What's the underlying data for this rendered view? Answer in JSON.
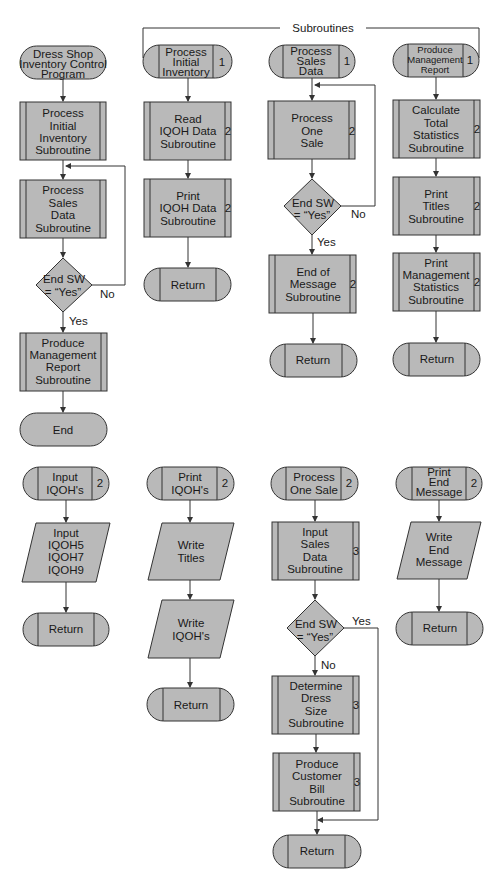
{
  "header": {
    "label": "Subroutines"
  },
  "main_program": {
    "start": [
      "Dress Shop",
      "Inventory Control",
      "Program"
    ],
    "step1": [
      "Process",
      "Initial",
      "Inventory",
      "Subroutine"
    ],
    "step2": [
      "Process",
      "Sales",
      "Data",
      "Subroutine"
    ],
    "decision": [
      "End SW",
      "= “Yes”"
    ],
    "decision_no": "No",
    "decision_yes": "Yes",
    "step3": [
      "Produce",
      "Management",
      "Report",
      "Subroutine"
    ],
    "end": "End"
  },
  "sub_initial_inventory": {
    "title": [
      "Process",
      "Initial",
      "Inventory"
    ],
    "level": "1",
    "step1": [
      "Read",
      "IQOH Data",
      "Subroutine"
    ],
    "step1_level": "2",
    "step2": [
      "Print",
      "IQOH Data",
      "Subroutine"
    ],
    "step2_level": "2",
    "return": "Return"
  },
  "sub_sales_data": {
    "title": [
      "Process",
      "Sales",
      "Data"
    ],
    "level": "1",
    "step1": [
      "Process",
      "One",
      "Sale"
    ],
    "step1_level": "2",
    "decision": [
      "End SW",
      "= “Yes”"
    ],
    "decision_no": "No",
    "decision_yes": "Yes",
    "step2": [
      "End of",
      "Message",
      "Subroutine"
    ],
    "step2_level": "2",
    "return": "Return"
  },
  "sub_management_report": {
    "title": [
      "Produce",
      "Management",
      "Report"
    ],
    "level": "1",
    "step1": [
      "Calculate",
      "Total",
      "Statistics",
      "Subroutine"
    ],
    "step1_level": "2",
    "step2": [
      "Print",
      "Titles",
      "Subroutine"
    ],
    "step2_level": "2",
    "step3": [
      "Print",
      "Management",
      "Statistics",
      "Subroutine"
    ],
    "step3_level": "2",
    "return": "Return"
  },
  "sub_input_iqoh": {
    "title": [
      "Input",
      "IQOH's"
    ],
    "level": "2",
    "io": [
      "Input",
      "IQOH5",
      "IQOH7",
      "IQOH9"
    ],
    "return": "Return"
  },
  "sub_print_iqoh": {
    "title": [
      "Print",
      "IQOH's"
    ],
    "level": "2",
    "io1": [
      "Write",
      "Titles"
    ],
    "io2": [
      "Write",
      "IQOH's"
    ],
    "return": "Return"
  },
  "sub_one_sale": {
    "title": [
      "Process",
      "One Sale"
    ],
    "level": "2",
    "step1": [
      "Input",
      "Sales",
      "Data",
      "Subroutine"
    ],
    "step1_level": "3",
    "decision": [
      "End SW",
      "= “Yes”"
    ],
    "decision_yes": "Yes",
    "decision_no": "No",
    "step2": [
      "Determine",
      "Dress",
      "Size",
      "Subroutine"
    ],
    "step2_level": "3",
    "step3": [
      "Produce",
      "Customer",
      "Bill",
      "Subroutine"
    ],
    "step3_level": "3",
    "return": "Return"
  },
  "sub_end_message": {
    "title": [
      "Print",
      "End",
      "Message"
    ],
    "level": "2",
    "io": [
      "Write",
      "End",
      "Message"
    ],
    "return": "Return"
  },
  "colors": {
    "fill": "#b9b9b9",
    "stroke": "#333333",
    "background": "#ffffff"
  }
}
